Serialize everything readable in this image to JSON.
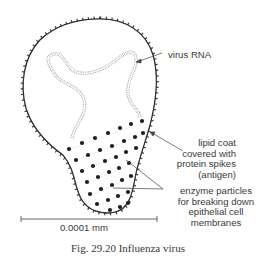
{
  "figure": {
    "caption": "Fig. 29.20    Influenza virus",
    "subject": "Influenza virus"
  },
  "labels": {
    "rna": "virus RNA",
    "lipid": [
      "lipid coat",
      "covered with",
      "protein spikes",
      "(antigen)"
    ],
    "enzyme": [
      "enzyme particles",
      "for breaking down",
      "epithelial cell",
      "membranes"
    ]
  },
  "scale_bar": {
    "label": "0.0001 mm"
  },
  "colors": {
    "ink": "#2a2a2a",
    "rna": "#9a9a9a",
    "text": "#3a3a3a"
  }
}
